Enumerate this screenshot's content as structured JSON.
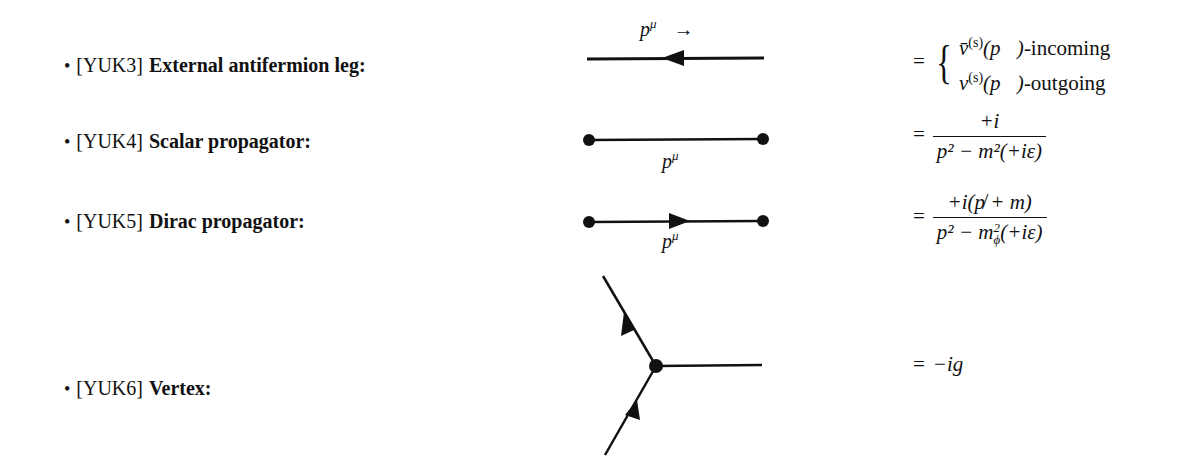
{
  "rules": [
    {
      "bullet": "•",
      "tag": "[YUK3]",
      "name": "External antifermion leg:",
      "diagram": "line-arrow-left",
      "momentum_label": "p",
      "momentum_sup": "μ",
      "momentum_arrow": "→",
      "formula": {
        "equals": "=",
        "cases": [
          {
            "symbol": "v̄",
            "sup": "(s)",
            "arg": "(p⃗)",
            "suffix": "-incoming"
          },
          {
            "symbol": "v",
            "sup": "(s)",
            "arg": "(p⃗)",
            "suffix": "-outgoing"
          }
        ]
      }
    },
    {
      "bullet": "•",
      "tag": "[YUK4]",
      "name": "Scalar propagator:",
      "diagram": "dotted-line",
      "momentum_label": "p",
      "momentum_sup": "μ",
      "formula": {
        "equals": "=",
        "numerator": "+i",
        "denominator": "p² − m²(+iε)"
      }
    },
    {
      "bullet": "•",
      "tag": "[YUK5]",
      "name": "Dirac propagator:",
      "diagram": "dotted-line-arrow-right",
      "momentum_label": "p",
      "momentum_sup": "μ",
      "formula": {
        "equals": "=",
        "numerator": "+i(p̸ + m)",
        "denominator_pre": "p² − m",
        "denominator_sup": "2",
        "denominator_sub": "ϕ",
        "denominator_post": "(+iε)"
      }
    },
    {
      "bullet": "•",
      "tag": "[YUK6]",
      "name": "Vertex:",
      "diagram": "three-leg-vertex",
      "formula": {
        "equals": "=",
        "value": "−ig"
      }
    }
  ]
}
